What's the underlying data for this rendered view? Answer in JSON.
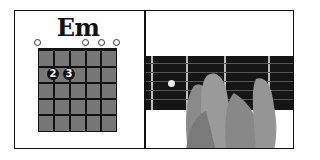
{
  "chord": {
    "name": "Em",
    "strings": 6,
    "frets": 5,
    "open_strings": [
      1,
      4,
      5,
      6
    ],
    "fingers": [
      {
        "string": 2,
        "fret": 2,
        "label": "2"
      },
      {
        "string": 3,
        "fret": 2,
        "label": "3"
      }
    ]
  },
  "photo": {
    "description": "hand-fretting-em-chord-photo"
  },
  "colors": {
    "grid_fill": "#777777",
    "lines": "#111111",
    "finger_dot": "#111111",
    "fretboard": "#151515"
  }
}
